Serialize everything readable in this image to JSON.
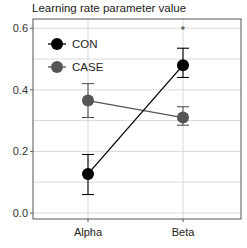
{
  "chart_data": {
    "type": "line",
    "title": "Learning rate parameter value",
    "xlabel": "",
    "ylabel": "Learning rate parameter value",
    "categories": [
      "Alpha",
      "Beta"
    ],
    "ylim": [
      -0.02,
      0.63
    ],
    "yticks": [
      0.0,
      0.2,
      0.4,
      0.6
    ],
    "ytick_labels": [
      "0.0",
      "0.2",
      "0.4",
      "0.6"
    ],
    "grid": true,
    "legend_position": "upper left",
    "series": [
      {
        "name": "CON",
        "color": "#000000",
        "values": [
          0.127,
          0.48
        ],
        "err_low": [
          0.06,
          0.44
        ],
        "err_high": [
          0.19,
          0.535
        ]
      },
      {
        "name": "CASE",
        "color": "#555555",
        "values": [
          0.365,
          0.31
        ],
        "err_low": [
          0.31,
          0.285
        ],
        "err_high": [
          0.42,
          0.345
        ]
      }
    ],
    "annotations": [
      {
        "text": "*",
        "category": "Beta",
        "y": 0.6
      }
    ]
  }
}
